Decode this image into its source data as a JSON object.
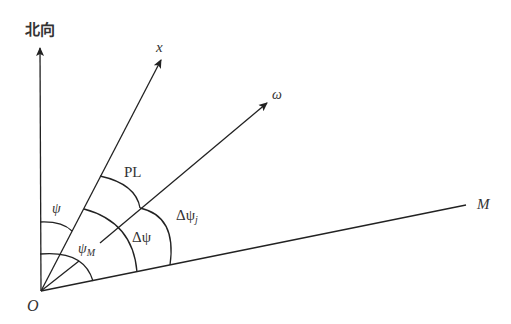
{
  "diagram": {
    "title": "",
    "axes": {
      "north": {
        "label": "北向"
      },
      "x": {
        "label": "x"
      },
      "omega": {
        "label": "ω"
      },
      "m": {
        "label": "M"
      },
      "origin": {
        "label": "O"
      }
    },
    "angles": {
      "psi": {
        "label": "ψ",
        "description": "angle from north to x"
      },
      "psi_m": {
        "label": "ψ",
        "sub": "M",
        "description": "angle from north to M"
      },
      "delta_psi": {
        "label": "Δψ",
        "description": "angle from x to M"
      },
      "pl": {
        "label": "PL",
        "description": "angle from x to ω"
      },
      "delta_psi_j": {
        "label": "Δψ",
        "sub": "j",
        "description": "angle from ω to M"
      }
    },
    "colors": {
      "stroke": "#222222",
      "text": "#333333",
      "background": "#ffffff"
    }
  }
}
